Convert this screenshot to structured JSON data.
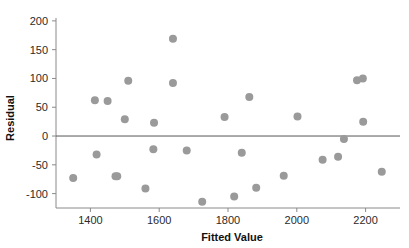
{
  "chart_data": {
    "type": "scatter",
    "title": "",
    "xlabel": "Fitted Value",
    "ylabel": "Residual",
    "xlim": [
      1300,
      2300
    ],
    "ylim": [
      -125,
      205
    ],
    "xticks": [
      1400,
      1600,
      1800,
      2000,
      2200
    ],
    "yticks": [
      200,
      150,
      100,
      50,
      0,
      -50,
      -100
    ],
    "xtick_labels": [
      "1400",
      "1600",
      "1800",
      "2000",
      "2200"
    ],
    "ytick_labels": [
      "200",
      "150",
      "100",
      "50",
      "0",
      "-50",
      "-100"
    ],
    "grid": false,
    "legend": null,
    "reference_line": {
      "type": "horizontal",
      "y": 0
    },
    "marker": {
      "shape": "circle",
      "color": "#9a9a9a",
      "size": 4
    },
    "points": [
      {
        "x": 1350,
        "y": -73
      },
      {
        "x": 1413,
        "y": 62
      },
      {
        "x": 1418,
        "y": -32
      },
      {
        "x": 1450,
        "y": 61
      },
      {
        "x": 1473,
        "y": -70
      },
      {
        "x": 1500,
        "y": 29
      },
      {
        "x": 1510,
        "y": 96
      },
      {
        "x": 1478,
        "y": -70
      },
      {
        "x": 1560,
        "y": -91
      },
      {
        "x": 1585,
        "y": 23
      },
      {
        "x": 1583,
        "y": -23
      },
      {
        "x": 1640,
        "y": 169
      },
      {
        "x": 1640,
        "y": 92
      },
      {
        "x": 1680,
        "y": -25
      },
      {
        "x": 1725,
        "y": -114
      },
      {
        "x": 1790,
        "y": 33
      },
      {
        "x": 1818,
        "y": -105
      },
      {
        "x": 1840,
        "y": -29
      },
      {
        "x": 1862,
        "y": 68
      },
      {
        "x": 1882,
        "y": -90
      },
      {
        "x": 1962,
        "y": -69
      },
      {
        "x": 2002,
        "y": 34
      },
      {
        "x": 2075,
        "y": -41
      },
      {
        "x": 2120,
        "y": -36
      },
      {
        "x": 2137,
        "y": -5
      },
      {
        "x": 2175,
        "y": 97
      },
      {
        "x": 2192,
        "y": 100
      },
      {
        "x": 2193,
        "y": 25
      },
      {
        "x": 2247,
        "y": -62
      }
    ]
  },
  "axes": {
    "x_title": "Fitted Value",
    "y_title": "Residual"
  }
}
